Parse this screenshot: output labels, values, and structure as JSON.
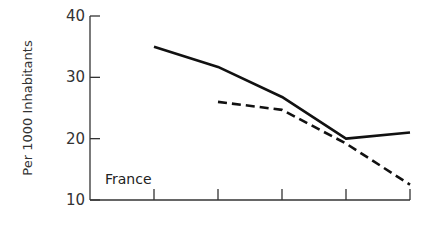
{
  "chart_data": {
    "type": "line",
    "title": "",
    "panel_label": "France",
    "xlabel": "",
    "ylabel": "Per 1000 Inhabitants",
    "ylim": [
      10,
      40
    ],
    "yticks": [
      10,
      20,
      30,
      40
    ],
    "x_tick_count": 6,
    "x": [
      0,
      1,
      2,
      3,
      4,
      5
    ],
    "x_tick_labels": [
      "",
      "",
      "",
      "",
      "",
      ""
    ],
    "grid": false,
    "legend": "none",
    "series": [
      {
        "name": "solid line",
        "style": "solid",
        "x": [
          1,
          2,
          3,
          4,
          5
        ],
        "values": [
          35,
          31.7,
          26.8,
          20,
          21
        ]
      },
      {
        "name": "dashed line",
        "style": "dashed",
        "x": [
          2,
          3,
          4,
          5
        ],
        "values": [
          26,
          24.7,
          19.2,
          12.5
        ]
      }
    ]
  },
  "colors": {
    "line": "#111111",
    "axis": "#333333",
    "background": "#ffffff"
  }
}
